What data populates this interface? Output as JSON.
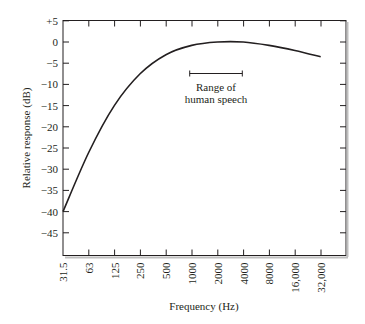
{
  "chart_data": {
    "type": "line",
    "title": "",
    "xlabel": "Frequency (Hz)",
    "ylabel": "Relative response (dB)",
    "x_scale": "log2",
    "categories": [
      "31.5",
      "63",
      "125",
      "250",
      "500",
      "1000",
      "2000",
      "4000",
      "8000",
      "16,000",
      "32,000"
    ],
    "yticks": [
      "+5",
      "0",
      "−5",
      "−10",
      "−15",
      "−20",
      "−25",
      "−30",
      "−35",
      "−40",
      "−45"
    ],
    "ylim": [
      -50,
      5
    ],
    "grid": false,
    "legend": null,
    "series": [
      {
        "name": "Relative response",
        "x": [
          31.5,
          63,
          125,
          250,
          500,
          1000,
          2000,
          4000,
          8000,
          16000,
          32000
        ],
        "values": [
          -40,
          -26,
          -15,
          -7.5,
          -3,
          -0.8,
          0,
          0,
          -0.8,
          -2,
          -3.5
        ]
      }
    ],
    "annotations": [
      {
        "text_line1": "Range of",
        "text_line2": "human speech",
        "x_start_hz": 1000,
        "x_end_hz": 4000,
        "y_db": -7.5
      }
    ]
  }
}
